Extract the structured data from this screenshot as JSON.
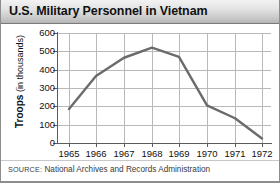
{
  "title": "U.S. Military Personnel in Vietnam",
  "source": {
    "label": "SOURCE:",
    "text": " National Archives and Records Administration"
  },
  "axis": {
    "y_title_strong": "Troops",
    "y_title_light": " (in thousands)"
  },
  "chart_data": {
    "type": "line",
    "title": "U.S. Military Personnel in Vietnam",
    "xlabel": "",
    "ylabel": "Troops (in thousands)",
    "x": [
      "1965",
      "1966",
      "1967",
      "1968",
      "1969",
      "1970",
      "1971",
      "1972"
    ],
    "categories": [
      "1965",
      "1966",
      "1967",
      "1968",
      "1969",
      "1970",
      "1971",
      "1972"
    ],
    "values": [
      185,
      365,
      465,
      520,
      470,
      205,
      135,
      25
    ],
    "series": [
      {
        "name": "Troops in Vietnam",
        "values": [
          185,
          365,
          465,
          520,
          470,
          205,
          135,
          25
        ]
      }
    ],
    "ylim": [
      0,
      600
    ],
    "yticks": [
      0,
      100,
      200,
      300,
      400,
      500,
      600
    ],
    "ytick_labels": [
      "0",
      "100",
      "200",
      "300",
      "400",
      "500",
      "600"
    ],
    "xtick_labels": [
      "1965",
      "1966",
      "1967",
      "1968",
      "1969",
      "1970",
      "1971",
      "1972"
    ],
    "grid": true,
    "legend": false,
    "line_color": "#6b6b6b",
    "grid_color": "#b9b9b9",
    "axis_color": "#5b5b5b"
  }
}
